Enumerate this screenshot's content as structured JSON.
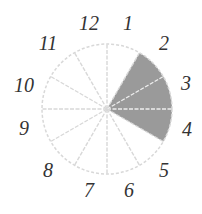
{
  "diagram": {
    "type": "clock-sector-diagram",
    "center": [
      107,
      109
    ],
    "radius": 65,
    "sector_count": 12,
    "shaded_from_deg": 30,
    "shaded_to_deg": 120,
    "colors": {
      "shade": "#9a9a9a",
      "line": "#d8d8d8",
      "label": "#333333"
    },
    "labels": [
      {
        "text": "12",
        "x": 89,
        "y": 30
      },
      {
        "text": "1",
        "x": 128,
        "y": 30
      },
      {
        "text": "2",
        "x": 164,
        "y": 50
      },
      {
        "text": "3",
        "x": 186,
        "y": 90
      },
      {
        "text": "4",
        "x": 187,
        "y": 136
      },
      {
        "text": "5",
        "x": 164,
        "y": 177
      },
      {
        "text": "6",
        "x": 129,
        "y": 197
      },
      {
        "text": "7",
        "x": 89,
        "y": 197
      },
      {
        "text": "8",
        "x": 48,
        "y": 177
      },
      {
        "text": "9",
        "x": 24,
        "y": 135
      },
      {
        "text": "10",
        "x": 24,
        "y": 92
      },
      {
        "text": "11",
        "x": 48,
        "y": 50
      }
    ]
  }
}
